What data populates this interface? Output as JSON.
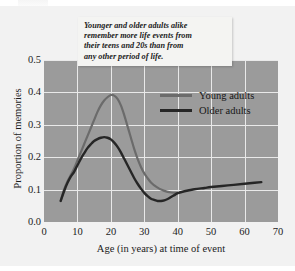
{
  "chart_data": {
    "type": "line",
    "title": "",
    "xlabel": "Age (in years) at time of event",
    "ylabel": "Proportion of memories",
    "xlim": [
      0,
      70
    ],
    "ylim": [
      0.0,
      0.5
    ],
    "xticks": [
      "0",
      "10",
      "20",
      "30",
      "40",
      "50",
      "60",
      "70"
    ],
    "yticks": [
      "0.0",
      "0.1",
      "0.2",
      "0.3",
      "0.4",
      "0.5"
    ],
    "grid": true,
    "legend_position": "upper-right-inside",
    "plot_background": "#9b9b9b",
    "gridline_color": "#e9e9e9",
    "annotation": {
      "lines": [
        "Younger and older adults alike",
        "remember more life events from",
        "their teens and 20s than from",
        "any other period of life."
      ]
    },
    "series": [
      {
        "name": "Young adults",
        "color": "#6b6b6b",
        "points": [
          [
            5,
            0.065
          ],
          [
            6,
            0.1
          ],
          [
            7,
            0.125
          ],
          [
            8,
            0.145
          ],
          [
            9,
            0.165
          ],
          [
            10,
            0.19
          ],
          [
            11,
            0.215
          ],
          [
            12,
            0.24
          ],
          [
            13,
            0.265
          ],
          [
            14,
            0.29
          ],
          [
            15,
            0.315
          ],
          [
            16,
            0.34
          ],
          [
            17,
            0.36
          ],
          [
            18,
            0.375
          ],
          [
            19,
            0.385
          ],
          [
            20,
            0.392
          ],
          [
            21,
            0.39
          ],
          [
            22,
            0.38
          ],
          [
            23,
            0.36
          ],
          [
            24,
            0.33
          ],
          [
            25,
            0.295
          ],
          [
            26,
            0.26
          ],
          [
            27,
            0.225
          ],
          [
            28,
            0.195
          ],
          [
            29,
            0.17
          ],
          [
            30,
            0.15
          ],
          [
            31,
            0.135
          ],
          [
            32,
            0.122
          ],
          [
            33,
            0.113
          ],
          [
            34,
            0.106
          ],
          [
            35,
            0.1
          ],
          [
            36,
            0.096
          ],
          [
            37,
            0.093
          ],
          [
            38,
            0.091
          ],
          [
            39,
            0.09
          ],
          [
            40,
            0.089
          ]
        ]
      },
      {
        "name": "Older adults",
        "color": "#262626",
        "points": [
          [
            5,
            0.065
          ],
          [
            6,
            0.095
          ],
          [
            7,
            0.12
          ],
          [
            8,
            0.14
          ],
          [
            9,
            0.155
          ],
          [
            10,
            0.175
          ],
          [
            11,
            0.195
          ],
          [
            12,
            0.212
          ],
          [
            13,
            0.228
          ],
          [
            14,
            0.24
          ],
          [
            15,
            0.25
          ],
          [
            16,
            0.256
          ],
          [
            17,
            0.26
          ],
          [
            18,
            0.262
          ],
          [
            19,
            0.26
          ],
          [
            20,
            0.255
          ],
          [
            21,
            0.245
          ],
          [
            22,
            0.232
          ],
          [
            23,
            0.215
          ],
          [
            24,
            0.195
          ],
          [
            25,
            0.175
          ],
          [
            26,
            0.155
          ],
          [
            27,
            0.135
          ],
          [
            28,
            0.118
          ],
          [
            29,
            0.103
          ],
          [
            30,
            0.09
          ],
          [
            31,
            0.08
          ],
          [
            32,
            0.072
          ],
          [
            33,
            0.068
          ],
          [
            34,
            0.065
          ],
          [
            35,
            0.065
          ],
          [
            36,
            0.067
          ],
          [
            37,
            0.071
          ],
          [
            38,
            0.077
          ],
          [
            39,
            0.083
          ],
          [
            40,
            0.089
          ],
          [
            42,
            0.095
          ],
          [
            45,
            0.101
          ],
          [
            48,
            0.105
          ],
          [
            50,
            0.108
          ],
          [
            55,
            0.113
          ],
          [
            60,
            0.118
          ],
          [
            63,
            0.121
          ],
          [
            65,
            0.123
          ]
        ]
      }
    ]
  },
  "legend": {
    "entries": [
      {
        "label": "Young adults",
        "color": "#6b6b6b"
      },
      {
        "label": "Older adults",
        "color": "#262626"
      }
    ]
  }
}
